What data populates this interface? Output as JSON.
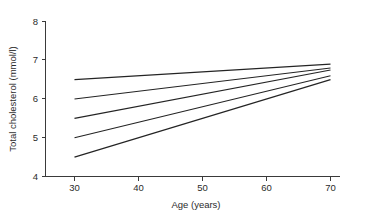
{
  "chart_data": {
    "type": "line",
    "title": "",
    "subtitle": "",
    "xlabel": "Age (years)",
    "ylabel": "Total cholesterol (mmol/l)",
    "xlim": [
      26,
      74
    ],
    "ylim": [
      4,
      8
    ],
    "xticks": [
      30,
      40,
      50,
      60,
      70
    ],
    "yticks": [
      4,
      5,
      6,
      7,
      8
    ],
    "xtick_labels": [
      "30",
      "40",
      "50",
      "60",
      "70"
    ],
    "ytick_labels": [
      "4",
      "5",
      "6",
      "7",
      "8"
    ],
    "grid": false,
    "legend": "none",
    "x": [
      30,
      70
    ],
    "series": [
      {
        "name": "line-1",
        "values": [
          6.5,
          6.9
        ]
      },
      {
        "name": "line-2",
        "values": [
          6.0,
          6.8
        ]
      },
      {
        "name": "line-3",
        "values": [
          5.5,
          6.75
        ]
      },
      {
        "name": "line-4",
        "values": [
          5.0,
          6.6
        ]
      },
      {
        "name": "line-5",
        "values": [
          4.5,
          6.5
        ]
      }
    ],
    "colors": {
      "line": "#242424",
      "axis": "#3a3a3a",
      "text": "#2b2b2b",
      "background": "#ffffff"
    }
  }
}
